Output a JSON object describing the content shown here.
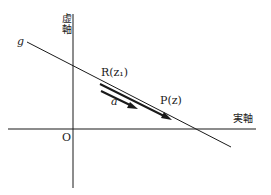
{
  "diagram": {
    "axes": {
      "imaginary_axis_label": "虚軸",
      "real_axis_label": "実軸",
      "origin_label": "O"
    },
    "line_label": "g",
    "points": [
      {
        "name": "R",
        "label": "R(z₁)"
      },
      {
        "name": "P",
        "label": "P(z)"
      }
    ],
    "vector_label": "a",
    "colors": {
      "stroke": "#1a1a1a",
      "background": "#ffffff"
    }
  }
}
